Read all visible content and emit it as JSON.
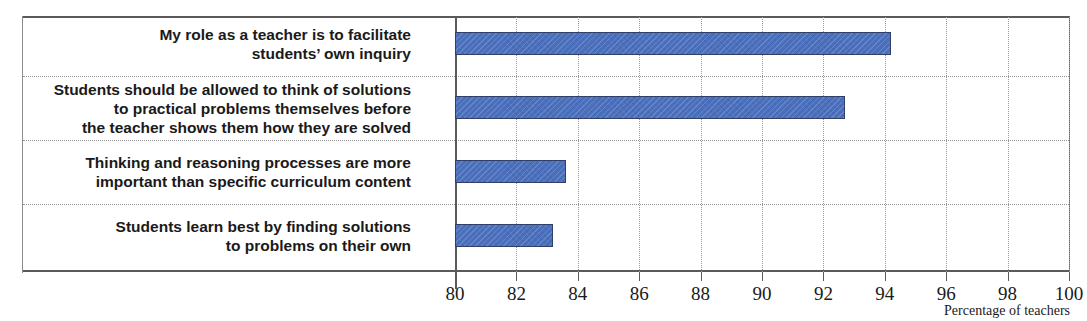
{
  "chart_data": {
    "type": "bar",
    "orientation": "horizontal",
    "title": "",
    "subtitle": "",
    "xlabel": "Percentage of teachers",
    "ylabel": "",
    "xlim": [
      80,
      100
    ],
    "xticks": [
      80,
      82,
      84,
      86,
      88,
      90,
      92,
      94,
      96,
      98,
      100
    ],
    "xtick_labels": [
      "80",
      "82",
      "84",
      "86",
      "88",
      "90",
      "92",
      "94",
      "96",
      "98",
      "100"
    ],
    "grid": true,
    "grid_axis": "x",
    "grid_style": "dotted",
    "legend": false,
    "legend_position": "none",
    "bar_color": "#4a6fbd",
    "bar_edge_color": "#2f3f66",
    "categories": [
      "My role as a teacher is to facilitate\nstudents’ own inquiry",
      "Students should be allowed to think of solutions\nto practical problems themselves before\nthe teacher shows them how they are solved",
      "Thinking and reasoning processes are more\nimportant than specific curriculum content",
      "Students learn best by finding solutions\nto problems on their own"
    ],
    "values": [
      94.2,
      92.7,
      83.6,
      83.2
    ]
  }
}
